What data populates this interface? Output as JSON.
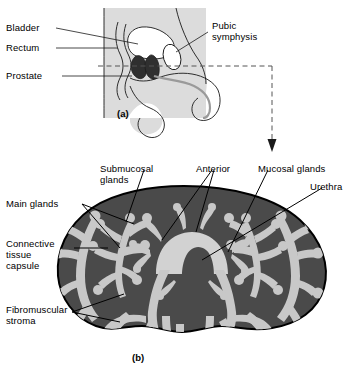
{
  "figure": {
    "colors": {
      "background": "#ffffff",
      "outline": "#000000",
      "body_shade_light": "#dcdcdc",
      "stroma_dark": "#4a4a4a",
      "gland_light": "#c8c8c8",
      "urethra_light": "#d2d2d2",
      "prostate_dark": "#3a3a3a",
      "dashed_line": "#555555"
    }
  },
  "panel_a": {
    "tag": "(a)",
    "labels": [
      {
        "id": "bladder",
        "text": "Bladder"
      },
      {
        "id": "rectum",
        "text": "Rectum"
      },
      {
        "id": "prostate",
        "text": "Prostate"
      },
      {
        "id": "pubic_symphysis",
        "line1": "Pubic",
        "line2": "symphysis"
      }
    ]
  },
  "panel_b": {
    "tag": "(b)",
    "labels": [
      {
        "id": "submucosal_glands",
        "line1": "Submucosal",
        "line2": "glands"
      },
      {
        "id": "anterior",
        "text": "Anterior"
      },
      {
        "id": "mucosal_glands",
        "text": "Mucosal glands"
      },
      {
        "id": "urethra",
        "text": "Urethra"
      },
      {
        "id": "main_glands",
        "text": "Main glands"
      },
      {
        "id": "connective_tissue_capsule",
        "line1": "Connective",
        "line2": "tissue",
        "line3": "capsule"
      },
      {
        "id": "fibromuscular_stroma",
        "line1": "Fibromuscular",
        "line2": "stroma"
      }
    ]
  }
}
